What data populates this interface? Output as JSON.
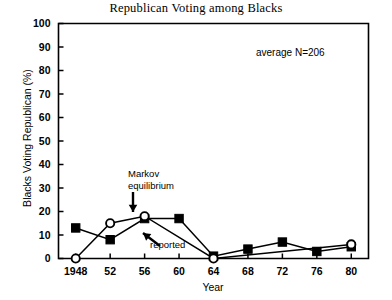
{
  "chart_data": {
    "type": "line",
    "title": "Republican Voting among Blacks",
    "xlabel": "Year",
    "ylabel": "Blacks Voting Republican (%)",
    "xlim": [
      1946,
      1982
    ],
    "ylim": [
      0,
      100
    ],
    "grid": false,
    "legend_position": "inline-annotations",
    "categories": [
      "1948",
      "52",
      "56",
      "60",
      "64",
      "68",
      "72",
      "76",
      "80"
    ],
    "x": [
      1948,
      1952,
      1956,
      1960,
      1964,
      1968,
      1972,
      1976,
      1980
    ],
    "series": [
      {
        "name": "reported",
        "marker": "filled-square",
        "values": [
          13,
          8,
          17,
          17,
          1,
          4,
          7,
          3,
          5
        ]
      },
      {
        "name": "Markov equilibrium",
        "marker": "open-circle",
        "values": [
          0,
          15,
          18,
          null,
          0,
          null,
          null,
          null,
          6
        ]
      }
    ],
    "ytick_labels": [
      "0",
      "10",
      "20",
      "30",
      "40",
      "50",
      "60",
      "70",
      "80",
      "90",
      "100"
    ],
    "ytick_values": [
      0,
      10,
      20,
      30,
      40,
      50,
      60,
      70,
      80,
      90,
      100
    ],
    "annotations": [
      {
        "name": "markov-equilibrium",
        "line1": "Markov",
        "line2": "equilibrium",
        "arrow": "down"
      },
      {
        "name": "reported",
        "text": "reported",
        "arrow": "up-left"
      },
      {
        "name": "average-n",
        "text": "average N=206"
      }
    ]
  },
  "axes": {
    "y_title": "Blacks Voting Republican (%)",
    "x_title": "Year",
    "y_ticks": [
      {
        "label": "100",
        "value": 100
      },
      {
        "label": "90",
        "value": 90
      },
      {
        "label": "80",
        "value": 80
      },
      {
        "label": "70",
        "value": 70
      },
      {
        "label": "60",
        "value": 60
      },
      {
        "label": "50",
        "value": 50
      },
      {
        "label": "40",
        "value": 40
      },
      {
        "label": "30",
        "value": 30
      },
      {
        "label": "20",
        "value": 20
      },
      {
        "label": "10",
        "value": 10
      },
      {
        "label": "0",
        "value": 0
      }
    ],
    "x_ticks": [
      {
        "label": "1948",
        "value": 1948
      },
      {
        "label": "52",
        "value": 1952
      },
      {
        "label": "56",
        "value": 1956
      },
      {
        "label": "60",
        "value": 1960
      },
      {
        "label": "64",
        "value": 1964
      },
      {
        "label": "68",
        "value": 1968
      },
      {
        "label": "72",
        "value": 1972
      },
      {
        "label": "76",
        "value": 1976
      },
      {
        "label": "80",
        "value": 1980
      }
    ]
  },
  "colors": {
    "foreground": "#000000",
    "background": "#ffffff"
  }
}
